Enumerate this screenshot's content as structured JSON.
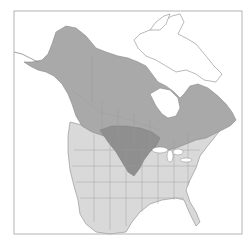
{
  "map": {
    "type": "range-map",
    "region": "North America",
    "colors": {
      "background": "#ffffff",
      "frame": "#b4b4b4",
      "land_base": "#d9d9d9",
      "land_arctic": "#ffffff",
      "range_primary": "#a9a9a9",
      "range_overlap": "#8f8f8f",
      "borders": "#9a9a9a",
      "coastline": "#8a8a8a"
    },
    "legend": []
  }
}
